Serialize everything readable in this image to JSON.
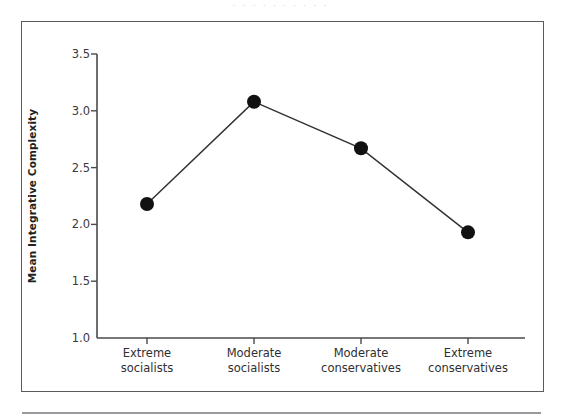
{
  "figure": {
    "top_artifact_text": ". . . . . . . . . .",
    "frame_color": "#5b5b5f",
    "footer_rule_color": "#9a9a9e"
  },
  "chart_data": {
    "type": "line",
    "title": "",
    "xlabel": "",
    "ylabel": "Mean Integrative Complexity",
    "categories": [
      "Extreme socialists",
      "Moderate socialists",
      "Moderate conservatives",
      "Extreme conservatives"
    ],
    "category_lines": [
      [
        "Extreme",
        "socialists"
      ],
      [
        "Moderate",
        "socialists"
      ],
      [
        "Moderate",
        "conservatives"
      ],
      [
        "Extreme",
        "conservatives"
      ]
    ],
    "values": [
      2.18,
      3.08,
      2.67,
      1.93
    ],
    "series": [
      {
        "name": "Mean Integrative Complexity",
        "values": [
          2.18,
          3.08,
          2.67,
          1.93
        ]
      }
    ],
    "ylim": [
      1.0,
      3.5
    ],
    "yticks": [
      1.0,
      1.5,
      2.0,
      2.5,
      3.0,
      3.5
    ],
    "ytick_labels": [
      "1.0",
      "1.5",
      "2.0",
      "2.5",
      "3.0",
      "3.5"
    ],
    "grid": false,
    "legend": "none",
    "marker": "filled-circle",
    "marker_color": "#111111",
    "line_color": "#333333"
  }
}
